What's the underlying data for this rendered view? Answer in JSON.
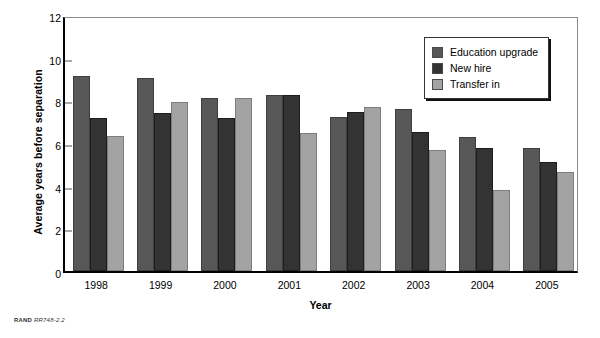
{
  "chart_data": {
    "type": "bar",
    "title": "",
    "xlabel": "Year",
    "ylabel": "Average years before separation",
    "categories": [
      "1998",
      "1999",
      "2000",
      "2001",
      "2002",
      "2003",
      "2004",
      "2005"
    ],
    "ylim": [
      0,
      12
    ],
    "yticks": [
      0,
      2,
      4,
      6,
      8,
      10,
      12
    ],
    "grid": false,
    "legend_position": "top-right",
    "series": [
      {
        "name": "Education upgrade",
        "color": "#575757",
        "values": [
          9.15,
          9.05,
          8.1,
          8.25,
          7.2,
          7.6,
          6.3,
          5.75
        ]
      },
      {
        "name": "New hire",
        "color": "#333333",
        "values": [
          7.15,
          7.4,
          7.15,
          8.25,
          7.45,
          6.5,
          5.75,
          5.1
        ]
      },
      {
        "name": "Transfer in",
        "color": "#a3a3a3",
        "values": [
          6.35,
          7.9,
          8.1,
          6.45,
          7.7,
          5.65,
          3.8,
          4.65
        ]
      }
    ]
  },
  "footer": {
    "source": "RAND",
    "code": "RR748-2.2"
  }
}
